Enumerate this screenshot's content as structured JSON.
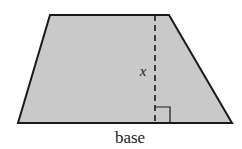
{
  "diagram": {
    "shape": "trapezoid",
    "fill_color": "#c9c9c9",
    "stroke_color": "#1a1a1a",
    "height_label": "x",
    "base_label": "base",
    "right_angle_marker": true,
    "height_line_style": "dashed"
  }
}
